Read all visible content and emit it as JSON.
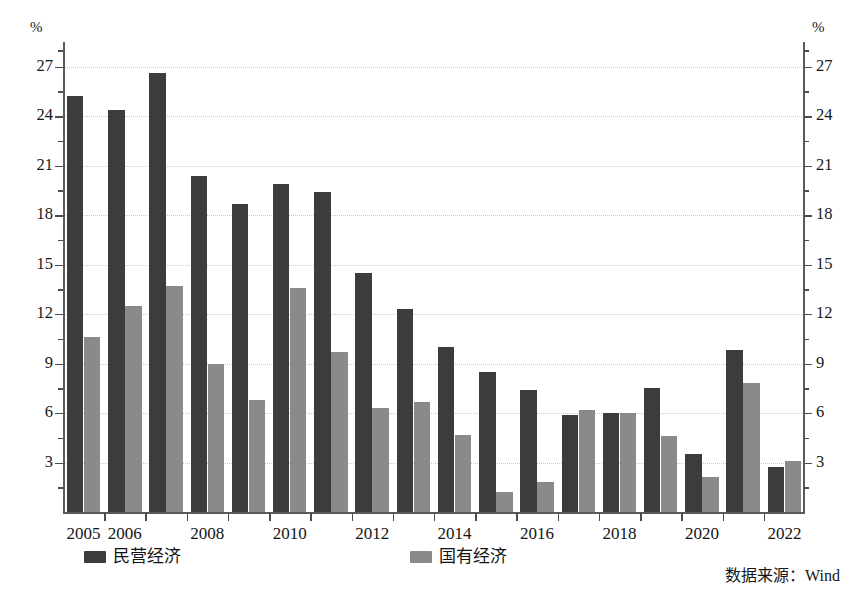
{
  "chart_data": {
    "type": "bar",
    "title": "",
    "subtitle": "",
    "xlabel": "",
    "ylabel": "%",
    "ylabel_right": "%",
    "ylim": [
      0,
      28.5
    ],
    "yticks": [
      3,
      6,
      9,
      12,
      15,
      18,
      21,
      24,
      27
    ],
    "ytick_labels": [
      "3",
      "6",
      "9",
      "12",
      "15",
      "18",
      "21",
      "24",
      "27"
    ],
    "minor_ticks": [
      1.5,
      4.5,
      7.5,
      10.5,
      13.5,
      16.5,
      19.5,
      22.5,
      25.5,
      28
    ],
    "grid": true,
    "grid_axis": "y",
    "legend_position": "bottom",
    "categories": [
      2005,
      2006,
      2007,
      2008,
      2009,
      2010,
      2011,
      2012,
      2013,
      2014,
      2015,
      2016,
      2017,
      2018,
      2019,
      2020,
      2021,
      2022
    ],
    "xtick_labels": [
      "2005",
      "2006",
      "",
      "2008",
      "",
      "2010",
      "",
      "2012",
      "",
      "2014",
      "",
      "2016",
      "",
      "2018",
      "",
      "2020",
      "",
      "2022"
    ],
    "series": [
      {
        "name": "民营经济",
        "color": "#3c3c3c",
        "values": [
          25.2,
          24.4,
          26.6,
          20.4,
          18.7,
          19.9,
          19.4,
          14.5,
          12.3,
          10.0,
          8.5,
          7.4,
          5.9,
          6.0,
          7.5,
          3.5,
          9.8,
          2.7
        ]
      },
      {
        "name": "国有经济",
        "color": "#8a8a8a",
        "values": [
          10.6,
          12.5,
          13.7,
          9.0,
          6.8,
          13.6,
          9.7,
          6.3,
          6.7,
          4.7,
          1.2,
          1.8,
          6.2,
          6.0,
          4.6,
          2.1,
          7.8,
          3.1
        ]
      }
    ],
    "source_note": "数据来源：Wind"
  },
  "legend": {
    "entries": [
      {
        "label": "民营经济",
        "swatch": "#3c3c3c"
      },
      {
        "label": "国有经济",
        "swatch": "#8a8a8a"
      }
    ]
  }
}
